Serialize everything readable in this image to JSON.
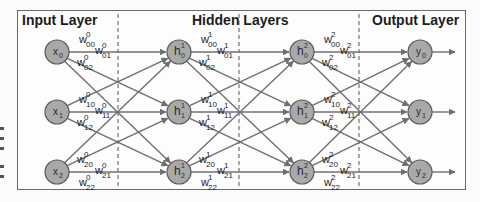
{
  "layers": {
    "input": {
      "title": "Input Layer"
    },
    "hidden": {
      "title": "Hidden Layers"
    },
    "output": {
      "title": "Output Layer"
    }
  },
  "colors": {
    "node_fill": "#a9a9a9",
    "node_stroke": "#5a5a5a",
    "edge": "#6f6f6f",
    "text": "#1c1c1c",
    "frame": "#6a6a6a"
  },
  "nodes": {
    "input": [
      {
        "base": "x",
        "sub": "0"
      },
      {
        "base": "x",
        "sub": "1"
      },
      {
        "base": "x",
        "sub": "2"
      }
    ],
    "hidden1": [
      {
        "base": "h",
        "sub": "0",
        "sup": "1"
      },
      {
        "base": "h",
        "sub": "1",
        "sup": "1"
      },
      {
        "base": "h",
        "sub": "2",
        "sup": "1"
      }
    ],
    "hidden2": [
      {
        "base": "h",
        "sub": "0",
        "sup": "2"
      },
      {
        "base": "h",
        "sub": "1",
        "sup": "2"
      },
      {
        "base": "h",
        "sub": "2",
        "sup": "2"
      }
    ],
    "output": [
      {
        "base": "y",
        "sub": "0"
      },
      {
        "base": "y",
        "sub": "1"
      },
      {
        "base": "y",
        "sub": "2"
      }
    ]
  },
  "weights": {
    "layer0": [
      {
        "sup": "0",
        "sub": "00"
      },
      {
        "sup": "0",
        "sub": "01"
      },
      {
        "sup": "0",
        "sub": "02"
      },
      {
        "sup": "0",
        "sub": "10"
      },
      {
        "sup": "0",
        "sub": "11"
      },
      {
        "sup": "0",
        "sub": "12"
      },
      {
        "sup": "0",
        "sub": "20"
      },
      {
        "sup": "0",
        "sub": "21"
      },
      {
        "sup": "0",
        "sub": "22"
      }
    ],
    "layer1": [
      {
        "sup": "1",
        "sub": "00"
      },
      {
        "sup": "1",
        "sub": "01"
      },
      {
        "sup": "1",
        "sub": "02"
      },
      {
        "sup": "1",
        "sub": "10"
      },
      {
        "sup": "1",
        "sub": "11"
      },
      {
        "sup": "1",
        "sub": "12"
      },
      {
        "sup": "1",
        "sub": "20"
      },
      {
        "sup": "1",
        "sub": "21"
      },
      {
        "sup": "1",
        "sub": "22"
      }
    ],
    "layer2": [
      {
        "sup": "2",
        "sub": "00"
      },
      {
        "sup": "2",
        "sub": "01"
      },
      {
        "sup": "2",
        "sub": "02"
      },
      {
        "sup": "2",
        "sub": "10"
      },
      {
        "sup": "2",
        "sub": "11"
      },
      {
        "sup": "2",
        "sub": "12"
      },
      {
        "sup": "2",
        "sub": "20"
      },
      {
        "sup": "2",
        "sub": "21"
      },
      {
        "sup": "2",
        "sub": "22"
      }
    ]
  }
}
